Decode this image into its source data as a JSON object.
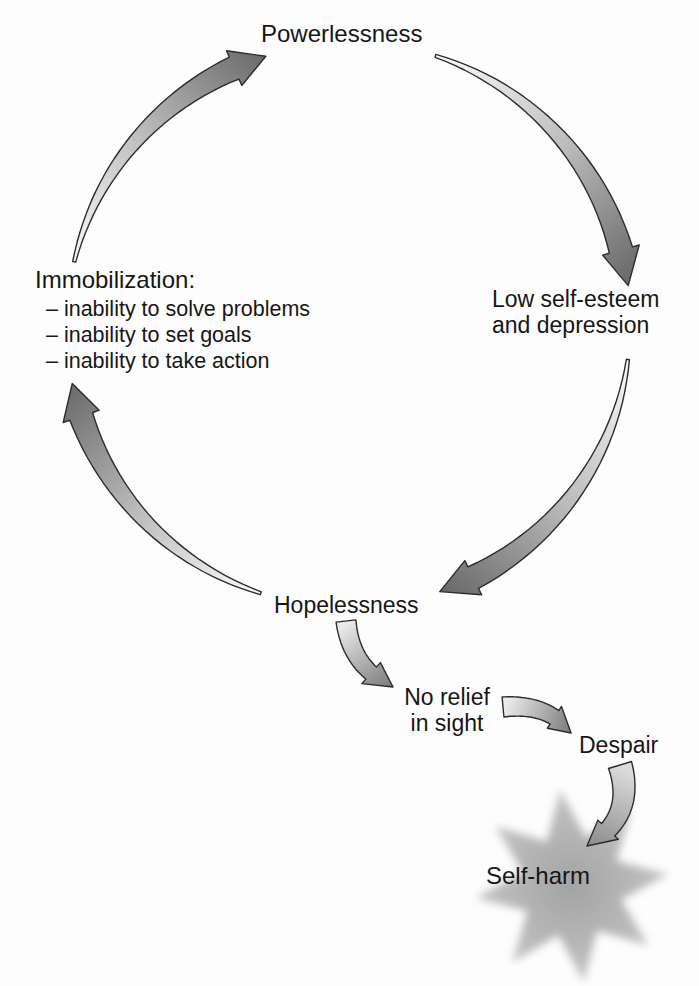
{
  "diagram": {
    "nodes": {
      "powerlessness": {
        "label": "Powerlessness"
      },
      "low_self_esteem": {
        "line1": "Low self-esteem",
        "line2": "and depression"
      },
      "immobilization": {
        "title": "Immobilization:",
        "bullets": [
          "– inability to solve problems",
          "– inability to set goals",
          "– inability to take action"
        ]
      },
      "hopelessness": {
        "label": "Hopelessness"
      },
      "no_relief": {
        "line1": "No relief",
        "line2": "in sight"
      },
      "despair": {
        "label": "Despair"
      },
      "self_harm": {
        "label": "Self-harm"
      }
    },
    "colors": {
      "background": "#fdfdfd",
      "text": "#161616",
      "outline": "#2c2c2c",
      "arrow_light": "#fafafa",
      "arrow_mid": "#bdbdbd",
      "arrow_dark": "#6a6a6a",
      "small_arrow_light": "#ececec",
      "small_arrow_dark": "#7b7b7b",
      "despair_arrow_light": "#dcdcdc",
      "despair_arrow_dark": "#8d8d8d",
      "star_center": "#a3a3a3",
      "star_edge": "#c5c5c5"
    }
  }
}
